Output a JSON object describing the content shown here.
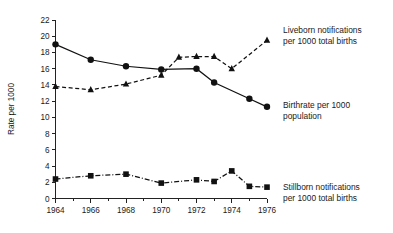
{
  "chart_data": {
    "type": "line",
    "title": "",
    "xlabel": "",
    "ylabel": "Rate per 1000",
    "xlim": [
      1964,
      1976
    ],
    "ylim": [
      0,
      22
    ],
    "grid": false,
    "legend_position": "inline-right",
    "x": [
      1964,
      1965,
      1966,
      1967,
      1968,
      1969,
      1970,
      1971,
      1972,
      1973,
      1974,
      1975,
      1976
    ],
    "x_tick_labels": [
      "1964",
      "1966",
      "1968",
      "1970",
      "1972",
      "1974",
      "1976"
    ],
    "x_tick_values": [
      1964,
      1966,
      1968,
      1970,
      1972,
      1974,
      1976
    ],
    "y_tick_labels": [
      "0",
      "2",
      "4",
      "6",
      "8",
      "10",
      "12",
      "14",
      "16",
      "18",
      "20",
      "22"
    ],
    "y_tick_values": [
      0,
      2,
      4,
      6,
      8,
      10,
      12,
      14,
      16,
      18,
      20,
      22
    ],
    "series": [
      {
        "name": "Birthrate per 1000 population",
        "marker": "circle",
        "line_style": "solid",
        "color": "#111111",
        "x": [
          1964,
          1966,
          1968,
          1970,
          1972,
          1973,
          1975,
          1976
        ],
        "values": [
          19.0,
          17.1,
          16.3,
          15.9,
          16.0,
          14.3,
          12.3,
          11.3
        ]
      },
      {
        "name": "Liveborn notifications per 1000 total births",
        "marker": "triangle",
        "line_style": "dashed",
        "color": "#111111",
        "x": [
          1964,
          1966,
          1968,
          1970,
          1971,
          1972,
          1973,
          1974,
          1976
        ],
        "values": [
          13.8,
          13.4,
          14.1,
          15.2,
          17.4,
          17.5,
          17.5,
          16.0,
          19.5
        ]
      },
      {
        "name": "Stillborn notifications per 1000 total births",
        "marker": "square",
        "line_style": "dashdot",
        "color": "#111111",
        "x": [
          1964,
          1966,
          1968,
          1970,
          1972,
          1973,
          1974,
          1975,
          1976
        ],
        "values": [
          2.4,
          2.8,
          3.0,
          1.9,
          2.3,
          2.1,
          3.4,
          1.5,
          1.4
        ]
      }
    ],
    "annotations": [
      {
        "id": "liveborn",
        "line1": "Liveborn notifications",
        "line2": "per 1000 total births"
      },
      {
        "id": "birthrate",
        "line1": "Birthrate per 1000",
        "line2": "population"
      },
      {
        "id": "stillborn",
        "line1": "Stillborn notifications",
        "line2": "per 1000 total births"
      }
    ]
  }
}
